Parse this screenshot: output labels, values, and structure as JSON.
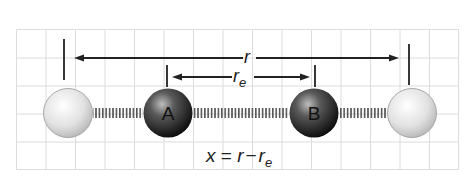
{
  "diagram": {
    "labels": {
      "r": "r",
      "re_main": "r",
      "re_sub": "e",
      "equation_x": "x",
      "equation_eq": " = ",
      "equation_r": "r",
      "equation_minus": "−",
      "equation_re": "r",
      "equation_re_sub": "e"
    },
    "atoms": [
      {
        "id": "left-displaced",
        "label": "",
        "shade": "light"
      },
      {
        "id": "A",
        "label": "A",
        "shade": "dark"
      },
      {
        "id": "B",
        "label": "B",
        "shade": "dark"
      },
      {
        "id": "right-displaced",
        "label": "",
        "shade": "light"
      }
    ],
    "colors": {
      "grid": "#dcdcdc",
      "line": "#222222",
      "dark_atom": "#2a2a2a",
      "light_atom": "#e6e6e6"
    }
  }
}
